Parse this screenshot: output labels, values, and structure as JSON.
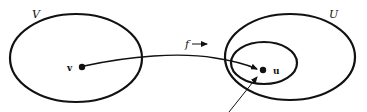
{
  "diagram": {
    "type": "set-mapping",
    "colors": {
      "stroke": "#111111",
      "background": "#ffffff"
    },
    "sets": [
      {
        "id": "V",
        "label": "V",
        "shape": "ellipse",
        "cx": 76,
        "cy": 58,
        "rx": 66,
        "ry": 44
      },
      {
        "id": "U",
        "label": "U",
        "shape": "ellipse",
        "cx": 290,
        "cy": 57,
        "rx": 65,
        "ry": 43
      },
      {
        "id": "neighborhood",
        "label": "",
        "shape": "ellipse",
        "cx": 264,
        "cy": 63,
        "rx": 33,
        "ry": 21
      }
    ],
    "points": [
      {
        "id": "v",
        "label": "v",
        "x": 82,
        "y": 67
      },
      {
        "id": "u",
        "label": "u",
        "x": 263,
        "y": 70
      }
    ],
    "mapping": {
      "label": "f",
      "from": "v",
      "to": "u",
      "direction_glyph": "→"
    },
    "pointer_arrow": {
      "from": [
        229,
        112
      ],
      "to": [
        256,
        77
      ]
    }
  }
}
